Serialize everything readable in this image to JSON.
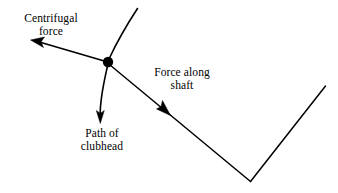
{
  "figure": {
    "type": "physics-force-diagram",
    "background_color": "#ffffff",
    "stroke_color": "#000000",
    "labels": {
      "centrifugal_force": {
        "line1": "Centrifugal",
        "line2": "force"
      },
      "force_along_shaft": {
        "line1": "Force along",
        "line2": "shaft"
      },
      "path_of_clubhead": {
        "line1": "Path of",
        "line2": "clubhead"
      }
    },
    "elements": {
      "clubhead_marker": "clubhead-dot",
      "centrifugal_arrow": "centrifugal-force-arrow",
      "shaft_arrow": "force-along-shaft-arrow",
      "path_arrow": "clubhead-path-arrow",
      "club_shaft": "club-shaft-line",
      "club_head_arm": "club-head-arm-line"
    }
  }
}
